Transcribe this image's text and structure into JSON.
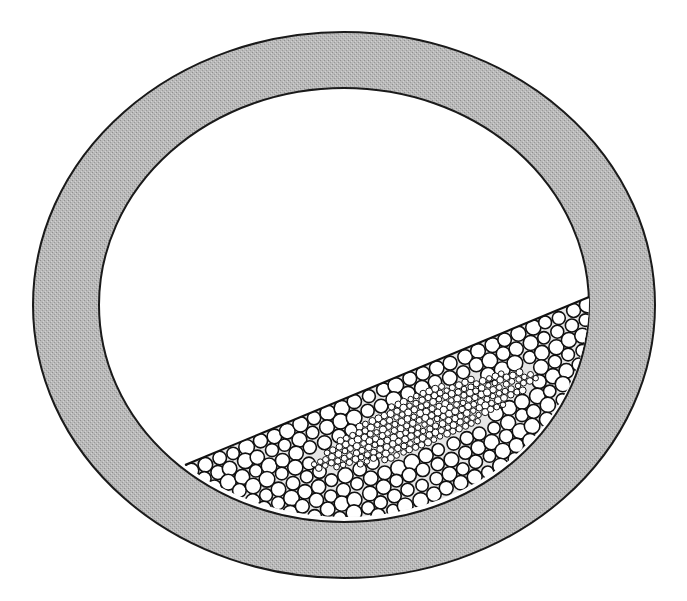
{
  "figure": {
    "colors": {
      "background": "#ffffff",
      "wall_fill": "#b8b8b8",
      "outline": "#1a1a1a",
      "particle_fill": "#ffffff",
      "particle_stroke": "#111111",
      "interstitial": "#e6e6e6"
    },
    "drum": {
      "center": [
        344,
        305
      ],
      "outer_radii": [
        311,
        273
      ],
      "inner_radii": [
        245,
        217
      ]
    },
    "bed": {
      "surface_left": [
        185,
        465
      ],
      "surface_right": [
        589,
        297
      ],
      "large_particle_radius": 7.2,
      "small_particle_radius": 3.2,
      "core_center": [
        425,
        420
      ],
      "core_half_length": 120,
      "core_half_width": 22
    }
  }
}
